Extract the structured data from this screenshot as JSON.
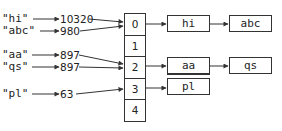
{
  "keys": [
    {
      "label": "\"hi\"",
      "hash": "10320",
      "bucket": 0
    },
    {
      "label": "\"abc\"",
      "hash": "980",
      "bucket": 0
    },
    {
      "label": "\"aa\"",
      "hash": "897",
      "bucket": 2
    },
    {
      "label": "\"qs\"",
      "hash": "897",
      "bucket": 2
    },
    {
      "label": "\"pl\"",
      "hash": "63",
      "bucket": 3
    }
  ],
  "buckets": [
    "0",
    "1",
    "2",
    "3",
    "4"
  ],
  "chains": {
    "bucket0": [
      "hi",
      "abc"
    ],
    "bucket2": [
      "aa",
      "qs"
    ],
    "bucket3": [
      "pl"
    ]
  },
  "colors": {
    "line": "#333333",
    "text": "#222222",
    "background": "#ffffff"
  }
}
